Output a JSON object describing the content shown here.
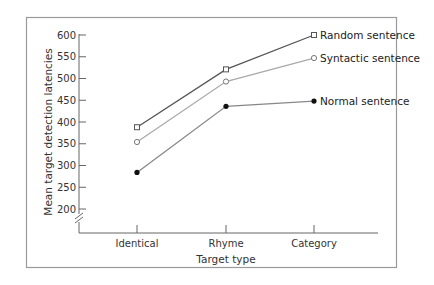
{
  "chart_data": {
    "type": "line",
    "title": "",
    "xlabel": "Target type",
    "ylabel": "Mean target detection latencies",
    "categories": [
      "Identical",
      "Rhyme",
      "Category"
    ],
    "yticks": [
      200,
      250,
      300,
      350,
      400,
      450,
      500,
      550,
      600
    ],
    "ylim": [
      200,
      600
    ],
    "axis_break": true,
    "grid": false,
    "legend_position": "inline-right",
    "series": [
      {
        "name": "Random sentence",
        "marker": "open-square",
        "color": "#555555",
        "values": [
          388,
          521,
          600
        ]
      },
      {
        "name": "Syntactic sentence",
        "marker": "open-circle",
        "color": "#aaaaaa",
        "values": [
          354,
          493,
          547
        ]
      },
      {
        "name": "Normal sentence",
        "marker": "filled-circle",
        "color": "#888888",
        "values": [
          284,
          436,
          448
        ]
      }
    ]
  },
  "ytick_labels": [
    "600",
    "550",
    "500",
    "450",
    "400",
    "350",
    "300",
    "250",
    "200"
  ]
}
